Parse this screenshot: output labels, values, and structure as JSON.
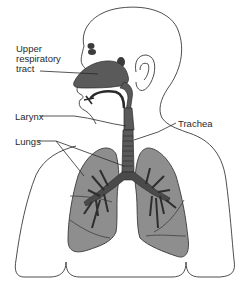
{
  "diagram": {
    "labels": {
      "upper_respiratory_tract": [
        "Upper",
        "respiratory",
        "tract"
      ],
      "larynx": "Larynx",
      "lungs": "Lungs",
      "trachea": "Trachea"
    },
    "colors": {
      "background": "#ffffff",
      "outline": "#3a3a3a",
      "lung_fill": "#8e8e8e",
      "airway_fill": "#5a5a5a",
      "text": "#2a2a2a"
    }
  }
}
